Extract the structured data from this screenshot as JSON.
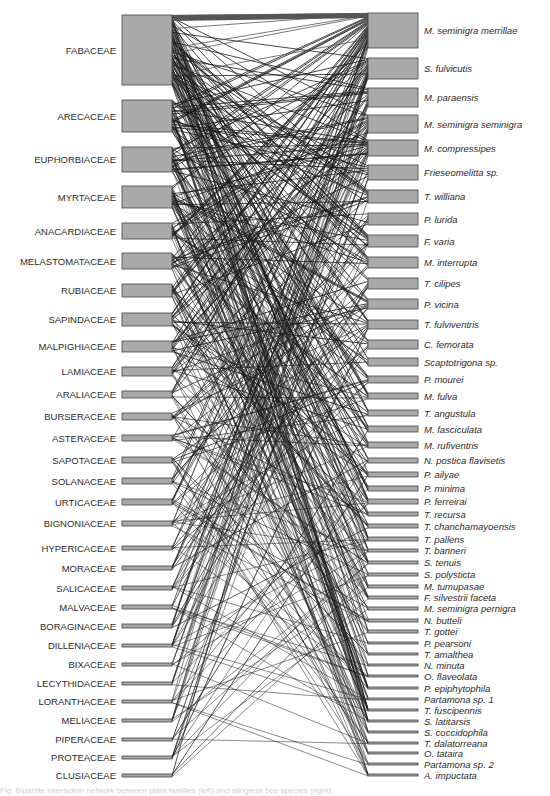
{
  "figure": {
    "type": "bipartite-network",
    "left_title": "",
    "right_title": "",
    "bar_color": "#a9a9a9",
    "bar_stroke": "#444444",
    "link_color": "#1a1a1a"
  },
  "plants": [
    {
      "label": "FABACEAE",
      "y0": 15,
      "y1": 85
    },
    {
      "label": "ARECACEAE",
      "y0": 100,
      "y1": 132
    },
    {
      "label": "EUPHORBIACEAE",
      "y0": 147,
      "y1": 172
    },
    {
      "label": "MYRTACEAE",
      "y0": 186,
      "y1": 208
    },
    {
      "label": "ANACARDIACEAE",
      "y0": 223,
      "y1": 239
    },
    {
      "label": "MELASTOMATACEAE",
      "y0": 253,
      "y1": 269
    },
    {
      "label": "RUBIACEAE",
      "y0": 284,
      "y1": 297
    },
    {
      "label": "SAPINDACEAE",
      "y0": 313,
      "y1": 326
    },
    {
      "label": "MALPIGHIACEAE",
      "y0": 341,
      "y1": 352
    },
    {
      "label": "LAMIACEAE",
      "y0": 367,
      "y1": 376
    },
    {
      "label": "ARALIACEAE",
      "y0": 391,
      "y1": 398
    },
    {
      "label": "BURSERACEAE",
      "y0": 413,
      "y1": 420
    },
    {
      "label": "ASTERACEAE",
      "y0": 435,
      "y1": 441
    },
    {
      "label": "SAPOTACEAE",
      "y0": 457,
      "y1": 463
    },
    {
      "label": "SOLANACEAE",
      "y0": 478,
      "y1": 484
    },
    {
      "label": "URTICACEAE",
      "y0": 499,
      "y1": 505
    },
    {
      "label": "BIGNONIACEAE",
      "y0": 521,
      "y1": 526
    },
    {
      "label": "HYPERICACEAE",
      "y0": 546,
      "y1": 550
    },
    {
      "label": "MORACEAE",
      "y0": 566,
      "y1": 570
    },
    {
      "label": "SALICACEAE",
      "y0": 586,
      "y1": 590
    },
    {
      "label": "MALVACEAE",
      "y0": 605,
      "y1": 609
    },
    {
      "label": "BORAGINACEAE",
      "y0": 624,
      "y1": 628
    },
    {
      "label": "DILLENIACEAE",
      "y0": 644,
      "y1": 647
    },
    {
      "label": "BIXACEAE",
      "y0": 663,
      "y1": 666
    },
    {
      "label": "LECYTHIDACEAE",
      "y0": 682,
      "y1": 685
    },
    {
      "label": "LORANTHACEAE",
      "y0": 700,
      "y1": 703
    },
    {
      "label": "MELIACEAE",
      "y0": 719,
      "y1": 722
    },
    {
      "label": "PIPERACEAE",
      "y0": 738,
      "y1": 741
    },
    {
      "label": "PROTEACEAE",
      "y0": 756,
      "y1": 759
    },
    {
      "label": "CLUSIACEAE",
      "y0": 774,
      "y1": 777
    }
  ],
  "bees": [
    {
      "label": "M. seminigra merrillae",
      "y0": 13,
      "y1": 48
    },
    {
      "label": "S. fulvicutis",
      "y0": 58,
      "y1": 79
    },
    {
      "label": "M. paraensis",
      "y0": 88,
      "y1": 107
    },
    {
      "label": "M. seminigra seminigra",
      "y0": 115,
      "y1": 133
    },
    {
      "label": "M. compressipes",
      "y0": 140,
      "y1": 156
    },
    {
      "label": "Frieseomelitta sp.",
      "y0": 165,
      "y1": 180
    },
    {
      "label": "T. williana",
      "y0": 190,
      "y1": 203
    },
    {
      "label": "P. lurida",
      "y0": 213,
      "y1": 225
    },
    {
      "label": "F. varia",
      "y0": 235,
      "y1": 247
    },
    {
      "label": "M. interrupta",
      "y0": 257,
      "y1": 268
    },
    {
      "label": "T. cilipes",
      "y0": 278,
      "y1": 289
    },
    {
      "label": "P. vicina",
      "y0": 299,
      "y1": 309
    },
    {
      "label": "T. fulviventris",
      "y0": 320,
      "y1": 329
    },
    {
      "label": "C. femorata",
      "y0": 340,
      "y1": 349
    },
    {
      "label": "Scaptotrigona sp.",
      "y0": 358,
      "y1": 366
    },
    {
      "label": "P. mourei",
      "y0": 376,
      "y1": 383
    },
    {
      "label": "M. fulva",
      "y0": 393,
      "y1": 399
    },
    {
      "label": "T. angustula",
      "y0": 410,
      "y1": 416
    },
    {
      "label": "M. fasciculata",
      "y0": 426,
      "y1": 432
    },
    {
      "label": "M. rufiventris",
      "y0": 442,
      "y1": 448
    },
    {
      "label": "N. postica flavisetis",
      "y0": 458,
      "y1": 463
    },
    {
      "label": "P. ailyae",
      "y0": 472,
      "y1": 477
    },
    {
      "label": "P. minima",
      "y0": 486,
      "y1": 491
    },
    {
      "label": "P. ferreirai",
      "y0": 499,
      "y1": 504
    },
    {
      "label": "T. recursa",
      "y0": 512,
      "y1": 516
    },
    {
      "label": "T. chanchamayoensis",
      "y0": 524,
      "y1": 528
    },
    {
      "label": "T. pallens",
      "y0": 537,
      "y1": 541
    },
    {
      "label": "T. banneri",
      "y0": 549,
      "y1": 552
    },
    {
      "label": "S. tenuis",
      "y0": 561,
      "y1": 564
    },
    {
      "label": "S. polysticta",
      "y0": 573,
      "y1": 576
    },
    {
      "label": "M. tumupasae",
      "y0": 585,
      "y1": 588
    },
    {
      "label": "F. silvestrii faceta",
      "y0": 596,
      "y1": 599
    },
    {
      "label": "M. seminigra pernigra",
      "y0": 607,
      "y1": 610
    },
    {
      "label": "N. butteli",
      "y0": 619,
      "y1": 622
    },
    {
      "label": "T. gottei",
      "y0": 630,
      "y1": 633
    },
    {
      "label": "P. pearsoni",
      "y0": 642,
      "y1": 644
    },
    {
      "label": "T. amalthea",
      "y0": 653,
      "y1": 655
    },
    {
      "label": "N. minuta",
      "y0": 664,
      "y1": 666
    },
    {
      "label": "O. flaveolata",
      "y0": 675,
      "y1": 677
    },
    {
      "label": "P. epiphytophila",
      "y0": 687,
      "y1": 689
    },
    {
      "label": "Partamona sp. 1",
      "y0": 698,
      "y1": 700
    },
    {
      "label": "T. fuscipennis",
      "y0": 709,
      "y1": 711
    },
    {
      "label": "S. latitarsis",
      "y0": 720,
      "y1": 722
    },
    {
      "label": "S. coccidophila",
      "y0": 731,
      "y1": 733
    },
    {
      "label": "T. dalatorreana",
      "y0": 742,
      "y1": 744
    },
    {
      "label": "O. tataira",
      "y0": 752,
      "y1": 754
    },
    {
      "label": "Partamona sp. 2",
      "y0": 763,
      "y1": 765
    },
    {
      "label": "A. impuctata",
      "y0": 774,
      "y1": 776
    }
  ],
  "caption": "Fig. Bipartite interaction network between plant families (left) and stingless bee species (right)."
}
